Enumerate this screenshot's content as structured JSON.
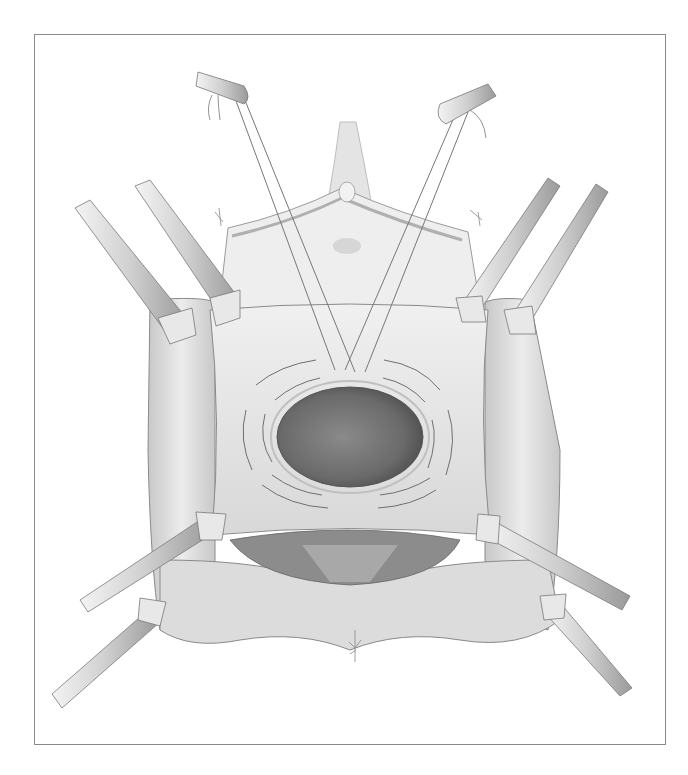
{
  "figure": {
    "type": "surgical-illustration",
    "style": "grayscale pencil rendering",
    "frame": {
      "border_color": "#8a8a8a",
      "background": "#ffffff"
    },
    "elements": {
      "central_opening": {
        "shape": "oval",
        "fill": "#6a6a6a"
      },
      "flap": {
        "fill": "#e6e6e6"
      },
      "upper_structure": {
        "fill": "#eeeeee"
      },
      "retractors": {
        "count": 6,
        "fill": "#d8d8d8"
      },
      "clamps": {
        "count": 2
      },
      "sutures_count": 12
    },
    "palette": {
      "dark": "#5a5a5a",
      "mid": "#a0a0a0",
      "light": "#e8e8e8",
      "line": "#707070"
    }
  }
}
